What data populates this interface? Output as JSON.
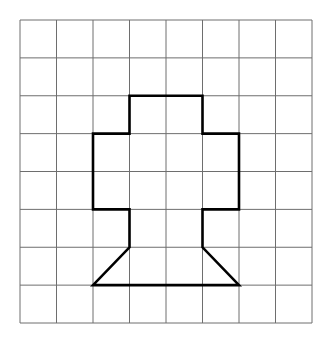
{
  "grid": {
    "cols": 8,
    "rows": 8,
    "x0": 20,
    "y0": 20,
    "x1": 312,
    "y1": 323,
    "line_color": "#6e6e6e",
    "line_width": 1
  },
  "shape": {
    "name": "tree-shape",
    "stroke_color": "#000000",
    "stroke_width": 2.6,
    "vertices_grid": [
      [
        3,
        2
      ],
      [
        5,
        2
      ],
      [
        5,
        3
      ],
      [
        6,
        3
      ],
      [
        6,
        5
      ],
      [
        5,
        5
      ],
      [
        5,
        6
      ],
      [
        6,
        7
      ],
      [
        2,
        7
      ],
      [
        3,
        6
      ],
      [
        3,
        5
      ],
      [
        2,
        5
      ],
      [
        2,
        3
      ],
      [
        3,
        3
      ]
    ]
  }
}
